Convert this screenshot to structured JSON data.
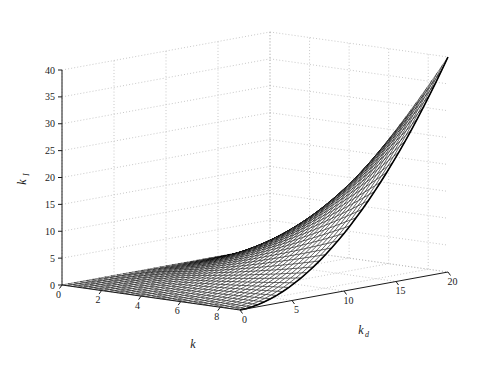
{
  "figure": {
    "background_color": "#ffffff",
    "axis_color": "#1a1a1a",
    "grid_color": "#b4b4b4",
    "mesh_color": "#000000",
    "face_color": "#ffffff"
  },
  "chart_data": {
    "type": "surface",
    "title": "",
    "xlabel": "k",
    "ylabel": "k_d",
    "zlabel": "k_I",
    "xlabel_plain": "k",
    "ylabel_base": "k",
    "ylabel_sub": "d",
    "zlabel_base": "k",
    "zlabel_sub": "I",
    "grid": true,
    "legend": false,
    "projection": "3d-mesh",
    "xlim": [
      0,
      9
    ],
    "ylim": [
      0,
      20
    ],
    "zlim": [
      0,
      40
    ],
    "xticks": [
      0,
      2,
      4,
      6,
      8
    ],
    "xtick_labels": [
      "0",
      "2",
      "4",
      "6",
      "8"
    ],
    "yticks": [
      0,
      5,
      10,
      15,
      20
    ],
    "ytick_labels": [
      "0",
      "5",
      "10",
      "15",
      "20"
    ],
    "zticks": [
      0,
      5,
      10,
      15,
      20,
      25,
      30,
      35,
      40
    ],
    "ztick_labels": [
      "0",
      "5",
      "10",
      "15",
      "20",
      "25",
      "30",
      "35",
      "40"
    ],
    "surface_description": "Monotonic mesh surface rising from near zero at the origin corner to a peak of about 40 at the far corner (k = 9, k_d = 20).",
    "peak_value": 40,
    "min_value": 0,
    "mesh_rows": 34,
    "mesh_cols": 34,
    "surface_z_formula": "z = 40 * ((x/9)^1.35) * ((y/20)^1.9) normalized to peak 40",
    "sample_grid": {
      "x": [
        0,
        1.8,
        3.6,
        5.4,
        7.2,
        9
      ],
      "y": [
        0,
        4,
        8,
        12,
        16,
        20
      ],
      "z_rows": [
        [
          0.0,
          0.0,
          0.0,
          0.0,
          0.0,
          0.0
        ],
        [
          0.0,
          0.1,
          0.4,
          0.9,
          1.5,
          2.3
        ],
        [
          0.0,
          0.3,
          1.1,
          2.2,
          3.8,
          5.9
        ],
        [
          0.0,
          0.5,
          1.9,
          4.0,
          6.8,
          10.4
        ],
        [
          0.0,
          0.8,
          2.9,
          6.2,
          10.4,
          16.1
        ],
        [
          0.0,
          1.1,
          4.1,
          8.7,
          14.8,
          22.8
        ]
      ]
    }
  },
  "axes_geometry": {
    "origin_label_note": "Front-left origin corner shows stacked zeros for the k axis and the k_I axis"
  }
}
